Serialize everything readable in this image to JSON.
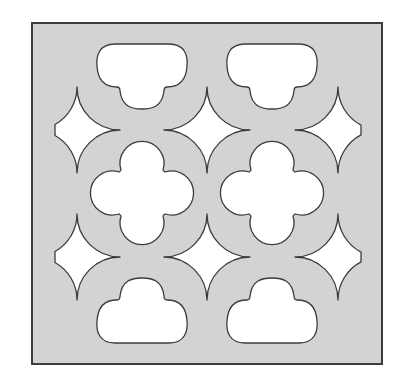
{
  "title": "Decorative lattice screen panel pattern",
  "colors": {
    "panel_fill": "#d3d3d3",
    "hole_fill": "#ffffff",
    "outline": "#3c3c3c",
    "background": "#ffffff"
  },
  "panel": {
    "x": 32,
    "y": 23,
    "width": 350,
    "height": 341,
    "border_width": 2
  },
  "grid": {
    "columns_x": [
      142,
      272
    ],
    "star_columns_x": [
      77,
      207,
      338
    ],
    "star_rows_y": [
      130,
      257
    ],
    "quatrefoil_row_y": 193,
    "top_cloud_y": 77,
    "bottom_cloud_y": 310
  },
  "shapes": {
    "top_clouds": [
      {
        "label": "top-left cloud cutout",
        "cx": 142
      },
      {
        "label": "top-right cloud cutout",
        "cx": 272
      }
    ],
    "stars": [
      {
        "label": "star-upper-left",
        "cx": 77,
        "cy": 130,
        "clip": "left"
      },
      {
        "label": "star-upper-middle",
        "cx": 207,
        "cy": 130,
        "clip": "none"
      },
      {
        "label": "star-upper-right",
        "cx": 338,
        "cy": 130,
        "clip": "right"
      },
      {
        "label": "star-lower-left",
        "cx": 77,
        "cy": 257,
        "clip": "left"
      },
      {
        "label": "star-lower-middle",
        "cx": 207,
        "cy": 257,
        "clip": "none"
      },
      {
        "label": "star-lower-right",
        "cx": 338,
        "cy": 257,
        "clip": "right"
      }
    ],
    "quatrefoils": [
      {
        "label": "quatrefoil-left",
        "cx": 142,
        "cy": 193
      },
      {
        "label": "quatrefoil-right",
        "cx": 272,
        "cy": 193
      }
    ],
    "bottom_clouds": [
      {
        "label": "bottom-left cloud cutout",
        "cx": 142
      },
      {
        "label": "bottom-right cloud cutout",
        "cx": 272
      }
    ]
  },
  "dimensions": {
    "star_radius": 43,
    "lobe_radius": 22,
    "side_clip_left_x": 55,
    "side_clip_right_x": 361
  }
}
